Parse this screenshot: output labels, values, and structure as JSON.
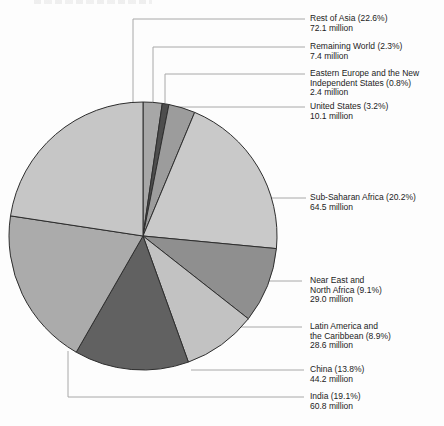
{
  "figure": {
    "background": "#fdfdfd",
    "cropped_top_text": "",
    "label_color": "#1c1c1c",
    "leader_line_color": "#a8a8a8",
    "slice_outline_color": "#2e2e2e"
  },
  "chart_data": {
    "type": "pie",
    "units": "million",
    "start_angle_deg": 0,
    "direction": "clockwise",
    "legend_position": "right-labels-with-leader-lines",
    "total_percent": 100.0,
    "slices": [
      {
        "name": "Remaining World",
        "pct": 2.3,
        "value_millions": 7.4,
        "label_lines": [
          "Remaining World (2.3%)"
        ],
        "value_label": "7.4 million",
        "color": "#a7a7a7"
      },
      {
        "name": "Eastern Europe and the New Independent States",
        "pct": 0.8,
        "value_millions": 2.4,
        "label_lines": [
          "Eastern Europe and the New",
          "Independent States  (0.8%)"
        ],
        "value_label": "2.4 million",
        "color": "#4d4d4d"
      },
      {
        "name": "United States",
        "pct": 3.2,
        "value_millions": 10.1,
        "label_lines": [
          "United States (3.2%)"
        ],
        "value_label": "10.1 million",
        "color": "#9c9c9c"
      },
      {
        "name": "Sub-Saharan Africa",
        "pct": 20.2,
        "value_millions": 64.5,
        "label_lines": [
          "Sub-Saharan Africa (20.2%)"
        ],
        "value_label": "64.5 million",
        "color": "#c9c9c9"
      },
      {
        "name": "Near East and North Africa",
        "pct": 9.1,
        "value_millions": 29.0,
        "label_lines": [
          "Near East and",
          "North Africa (9.1%)"
        ],
        "value_label": "29.0 million",
        "color": "#8f8f8f"
      },
      {
        "name": "Latin America and the Caribbean",
        "pct": 8.9,
        "value_millions": 28.6,
        "label_lines": [
          "Latin America and",
          "the Caribbean (8.9%)"
        ],
        "value_label": "28.6 million",
        "color": "#c2c2c2"
      },
      {
        "name": "China",
        "pct": 13.8,
        "value_millions": 44.2,
        "label_lines": [
          "China (13.8%)"
        ],
        "value_label": "44.2 million",
        "color": "#616161"
      },
      {
        "name": "India",
        "pct": 19.1,
        "value_millions": 60.8,
        "label_lines": [
          "India (19.1%)"
        ],
        "value_label": "60.8 million",
        "color": "#ababab"
      },
      {
        "name": "Rest of Asia",
        "pct": 22.6,
        "value_millions": 72.1,
        "label_lines": [
          "Rest of Asia (22.6%)"
        ],
        "value_label": "72.1 million",
        "color": "#c6c6c6"
      }
    ]
  }
}
